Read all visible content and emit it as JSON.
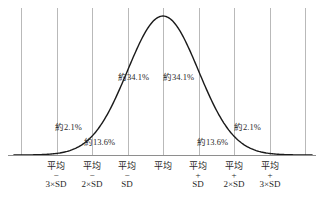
{
  "chart_data": {
    "type": "line",
    "title": "",
    "xlabel": "",
    "ylabel": "",
    "xlim": [
      -3.75,
      3.75
    ],
    "ylim": [
      0,
      1
    ],
    "grid": true,
    "legend": false,
    "gridline_positions_sd": [
      -4,
      -3,
      -2,
      -1,
      0,
      1,
      2,
      3
    ],
    "curve": {
      "name": "normal-pdf",
      "mean_sd": 0,
      "stddev_sd": 1,
      "peak_value": 1.0
    },
    "categories": [
      "-3SD",
      "-2SD",
      "-1SD",
      "mean",
      "+1SD",
      "+2SD",
      "+3SD"
    ],
    "segment_percents": [
      2.1,
      13.6,
      34.1,
      34.1,
      13.6,
      2.1
    ],
    "annotations": [
      {
        "text": "約2.1%",
        "value": 2.1,
        "x": 55,
        "y": 123
      },
      {
        "text": "約13.6%",
        "value": 13.6,
        "x": 84,
        "y": 138
      },
      {
        "text": "約34.1%",
        "value": 34.1,
        "x": 118,
        "y": 73
      },
      {
        "text": "約34.1%",
        "value": 34.1,
        "x": 163,
        "y": 73
      },
      {
        "text": "約13.6%",
        "value": 13.6,
        "x": 197,
        "y": 138
      },
      {
        "text": "約2.1%",
        "value": 2.1,
        "x": 234,
        "y": 123
      }
    ],
    "tick_labels": [
      {
        "mean": "平均",
        "sign": "−",
        "sd": "3×SD",
        "x": 56
      },
      {
        "mean": "平均",
        "sign": "−",
        "sd": "2×SD",
        "x": 92
      },
      {
        "mean": "平均",
        "sign": "−",
        "sd": "SD",
        "x": 127
      },
      {
        "mean": "平均",
        "sign": "",
        "sd": "",
        "x": 163
      },
      {
        "mean": "平均",
        "sign": "+",
        "sd": "SD",
        "x": 198
      },
      {
        "mean": "平均",
        "sign": "+",
        "sd": "2×SD",
        "x": 234
      },
      {
        "mean": "平均",
        "sign": "+",
        "sd": "3×SD",
        "x": 270
      }
    ],
    "colors": {
      "curve": "#1a1a1a",
      "gridline": "#b9b9b9",
      "axis": "#8e8e8e",
      "text": "#1f1f1f",
      "background": "#ffffff"
    }
  }
}
